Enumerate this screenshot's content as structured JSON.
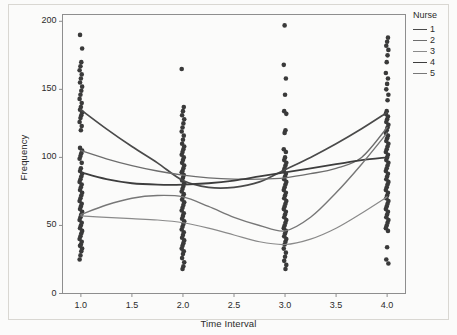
{
  "chart_data": {
    "type": "scatter",
    "title": "",
    "xlabel": "Time Interval",
    "ylabel": "Frequency",
    "xlim": [
      0.82,
      4.18
    ],
    "ylim": [
      0,
      205
    ],
    "grid": false,
    "xticks": [
      "1.0",
      "1.5",
      "2.0",
      "2.5",
      "3.0",
      "3.5",
      "4.0"
    ],
    "xtick_values": [
      1.0,
      1.5,
      2.0,
      2.5,
      3.0,
      3.5,
      4.0
    ],
    "yticks": [
      "0",
      "50",
      "100",
      "150",
      "200"
    ],
    "ytick_values": [
      0,
      50,
      100,
      150,
      200
    ],
    "legend": {
      "title": "Nurse",
      "position": "right",
      "entries": [
        {
          "label": "1",
          "color": "#4a4a4a"
        },
        {
          "label": "2",
          "color": "#6d6d6d"
        },
        {
          "label": "3",
          "color": "#8a8a8a"
        },
        {
          "label": "4",
          "color": "#3d3d3d"
        },
        {
          "label": "5",
          "color": "#777777"
        }
      ]
    },
    "point_color": "#3a3a3a",
    "point_size": 2.3,
    "scatter_columns": [
      {
        "x": 1.0,
        "y_values": [
          25,
          28,
          31,
          33,
          35,
          36,
          38,
          40,
          42,
          44,
          46,
          48,
          50,
          52,
          54,
          56,
          58,
          60,
          62,
          64,
          66,
          68,
          70,
          72,
          74,
          76,
          78,
          80,
          82,
          84,
          86,
          88,
          90,
          92,
          96,
          99,
          101,
          103,
          105,
          107,
          120,
          123,
          126,
          129,
          131,
          133,
          135,
          137,
          140,
          143,
          146,
          149,
          152,
          155,
          158,
          161,
          164,
          167,
          170,
          180,
          190
        ]
      },
      {
        "x": 2.0,
        "y_values": [
          18,
          20,
          23,
          26,
          29,
          31,
          33,
          35,
          37,
          39,
          41,
          43,
          45,
          47,
          49,
          51,
          53,
          55,
          57,
          59,
          61,
          63,
          65,
          67,
          69,
          71,
          73,
          75,
          77,
          79,
          81,
          83,
          85,
          87,
          89,
          90,
          92,
          94,
          96,
          98,
          100,
          102,
          104,
          106,
          108,
          110,
          113,
          116,
          119,
          122,
          125,
          128,
          131,
          134,
          137,
          165
        ]
      },
      {
        "x": 3.0,
        "y_values": [
          18,
          21,
          24,
          27,
          30,
          33,
          36,
          38,
          40,
          42,
          44,
          46,
          48,
          50,
          52,
          54,
          56,
          58,
          60,
          62,
          64,
          66,
          68,
          70,
          72,
          74,
          76,
          78,
          80,
          82,
          84,
          86,
          88,
          90,
          92,
          94,
          96,
          98,
          100,
          104,
          106,
          118,
          120,
          132,
          134,
          146,
          158,
          168,
          197
        ]
      },
      {
        "x": 4.0,
        "y_values": [
          22,
          25,
          34,
          46,
          48,
          50,
          52,
          54,
          56,
          58,
          60,
          62,
          64,
          66,
          68,
          70,
          72,
          74,
          76,
          78,
          80,
          82,
          84,
          86,
          88,
          90,
          92,
          94,
          96,
          98,
          100,
          102,
          104,
          106,
          108,
          110,
          112,
          114,
          116,
          118,
          120,
          122,
          124,
          126,
          128,
          130,
          132,
          134,
          142,
          146,
          150,
          154,
          158,
          162,
          170,
          175,
          179,
          182,
          185,
          188
        ]
      }
    ],
    "series": [
      {
        "name": "1",
        "color": "#4a4a4a",
        "width": 1.7,
        "x": [
          1.0,
          1.25,
          1.5,
          1.75,
          2.0,
          2.25,
          2.5,
          2.75,
          3.0,
          3.25,
          3.5,
          3.75,
          4.0
        ],
        "values": [
          135,
          121,
          108,
          96,
          83,
          78,
          78,
          82,
          91,
          100,
          110,
          121,
          133
        ]
      },
      {
        "name": "2",
        "color": "#6d6d6d",
        "width": 1.3,
        "x": [
          1.0,
          1.25,
          1.5,
          1.75,
          2.0,
          2.25,
          2.5,
          2.75,
          3.0,
          3.25,
          3.5,
          3.75,
          4.0
        ],
        "values": [
          105,
          99,
          94,
          90,
          87,
          85,
          84,
          84,
          85,
          88,
          92,
          100,
          122
        ]
      },
      {
        "name": "3",
        "color": "#8a8a8a",
        "width": 1.2,
        "x": [
          1.0,
          1.25,
          1.5,
          1.75,
          2.0,
          2.25,
          2.5,
          2.75,
          3.0,
          3.25,
          3.5,
          3.75,
          4.0
        ],
        "values": [
          57,
          56,
          55,
          54,
          52,
          48,
          43,
          38,
          36,
          40,
          48,
          59,
          71
        ]
      },
      {
        "name": "4",
        "color": "#3d3d3d",
        "width": 1.8,
        "x": [
          1.0,
          1.25,
          1.5,
          1.75,
          2.0,
          2.25,
          2.5,
          2.75,
          3.0,
          3.25,
          3.5,
          3.75,
          4.0
        ],
        "values": [
          89,
          84,
          81,
          80,
          80,
          81,
          83,
          86,
          89,
          92,
          95,
          98,
          100
        ]
      },
      {
        "name": "5",
        "color": "#777777",
        "width": 1.4,
        "x": [
          1.0,
          1.25,
          1.5,
          1.75,
          2.0,
          2.25,
          2.5,
          2.75,
          3.0,
          3.25,
          3.5,
          3.75,
          4.0
        ],
        "values": [
          58,
          65,
          70,
          72,
          71,
          64,
          56,
          50,
          46,
          56,
          74,
          95,
          118
        ]
      }
    ]
  },
  "axes": {
    "frame_color": "#8e8e8e",
    "plot_bg": "#fbfbfa"
  }
}
